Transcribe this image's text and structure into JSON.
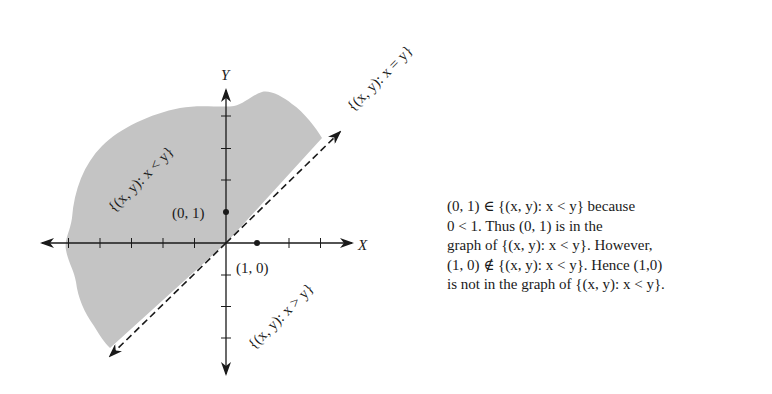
{
  "figure": {
    "axes": {
      "x_label": "X",
      "y_label": "Y",
      "origin_px": [
        226,
        243
      ],
      "tick_spacing_px": 31.5
    },
    "points": [
      {
        "label": "(0, 1)",
        "coords": [
          0,
          1
        ]
      },
      {
        "label": "(1, 0)",
        "coords": [
          1,
          0
        ]
      }
    ],
    "region_labels": {
      "less": "{(x, y): x < y}",
      "equal": "{(x, y): x = y}",
      "greater": "{(x, y): x > y}"
    },
    "colors": {
      "shaded_region": "#c4c4c4",
      "ink": "#1a1a1a",
      "background": "#ffffff"
    }
  },
  "caption": {
    "lines": [
      "(0, 1) ∈ {(x, y): x < y} because",
      "0 < 1.  Thus (0, 1) is in the",
      "graph of {(x, y): x < y}.  However,",
      "(1, 0) ∉ {(x, y): x < y}.  Hence (1,0)",
      "is not in the graph of {(x, y): x < y}."
    ]
  }
}
